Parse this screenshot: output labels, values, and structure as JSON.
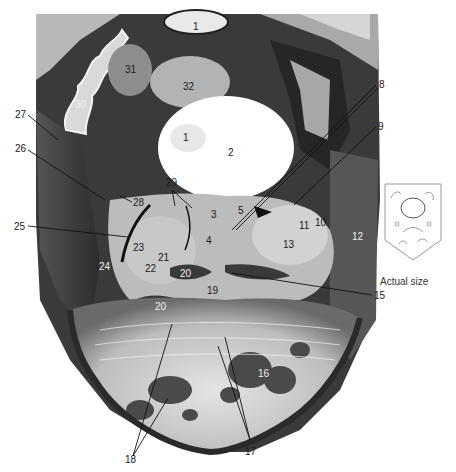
{
  "figure": {
    "type": "anatomical-section-photograph",
    "inset_caption": "Actual size",
    "labels": [
      {
        "id": "1a",
        "text": "1",
        "x": 193,
        "y": 22,
        "tone": "dark"
      },
      {
        "id": "1b",
        "text": "1",
        "x": 183,
        "y": 133,
        "tone": "dark"
      },
      {
        "id": "2",
        "text": "2",
        "x": 228,
        "y": 148,
        "tone": "dark"
      },
      {
        "id": "3",
        "text": "3",
        "x": 211,
        "y": 210,
        "tone": "dark"
      },
      {
        "id": "4",
        "text": "4",
        "x": 206,
        "y": 236,
        "tone": "dark"
      },
      {
        "id": "5",
        "text": "5",
        "x": 238,
        "y": 206,
        "tone": "dark"
      },
      {
        "id": "8",
        "text": "8",
        "x": 379,
        "y": 80,
        "tone": "dark"
      },
      {
        "id": "9",
        "text": "9",
        "x": 378,
        "y": 122,
        "tone": "dark"
      },
      {
        "id": "10",
        "text": "10",
        "x": 315,
        "y": 218,
        "tone": "dark"
      },
      {
        "id": "11",
        "text": "11",
        "x": 299,
        "y": 221,
        "tone": "dark"
      },
      {
        "id": "12",
        "text": "12",
        "x": 352,
        "y": 232,
        "tone": "light"
      },
      {
        "id": "13",
        "text": "13",
        "x": 283,
        "y": 240,
        "tone": "dark"
      },
      {
        "id": "15",
        "text": "15",
        "x": 374,
        "y": 291,
        "tone": "dark"
      },
      {
        "id": "16",
        "text": "16",
        "x": 258,
        "y": 369,
        "tone": "light"
      },
      {
        "id": "17",
        "text": "17",
        "x": 245,
        "y": 447,
        "tone": "dark"
      },
      {
        "id": "18",
        "text": "18",
        "x": 125,
        "y": 455,
        "tone": "dark"
      },
      {
        "id": "19",
        "text": "19",
        "x": 207,
        "y": 286,
        "tone": "dark"
      },
      {
        "id": "20a",
        "text": "20",
        "x": 180,
        "y": 269,
        "tone": "light"
      },
      {
        "id": "20b",
        "text": "20",
        "x": 155,
        "y": 302,
        "tone": "light"
      },
      {
        "id": "21",
        "text": "21",
        "x": 158,
        "y": 253,
        "tone": "dark"
      },
      {
        "id": "22",
        "text": "22",
        "x": 145,
        "y": 264,
        "tone": "dark"
      },
      {
        "id": "23",
        "text": "23",
        "x": 133,
        "y": 243,
        "tone": "dark"
      },
      {
        "id": "24",
        "text": "24",
        "x": 99,
        "y": 262,
        "tone": "light"
      },
      {
        "id": "25",
        "text": "25",
        "x": 14,
        "y": 222,
        "tone": "dark"
      },
      {
        "id": "26",
        "text": "26",
        "x": 15,
        "y": 144,
        "tone": "dark"
      },
      {
        "id": "27",
        "text": "27",
        "x": 15,
        "y": 110,
        "tone": "dark"
      },
      {
        "id": "28",
        "text": "28",
        "x": 133,
        "y": 198,
        "tone": "dark"
      },
      {
        "id": "29",
        "text": "29",
        "x": 166,
        "y": 178,
        "tone": "dark"
      },
      {
        "id": "30",
        "text": "30",
        "x": 75,
        "y": 100,
        "tone": "light"
      },
      {
        "id": "31",
        "text": "31",
        "x": 125,
        "y": 65,
        "tone": "dark"
      },
      {
        "id": "32",
        "text": "32",
        "x": 183,
        "y": 82,
        "tone": "dark"
      }
    ],
    "colors": {
      "background": "#ffffff",
      "tissue_dark": "#2a2a2a",
      "tissue_mid": "#8a8a8a",
      "tissue_light": "#d8d8d8",
      "ventricle": "#ffffff",
      "leader_line": "#111111"
    }
  }
}
